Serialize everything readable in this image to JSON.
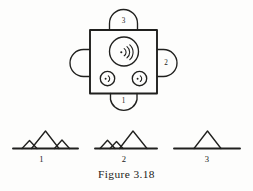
{
  "figure": {
    "caption": "Figure 3.18",
    "background_color": "#fdfdfc",
    "ink_color": "#20201e"
  },
  "device": {
    "name": "square-body",
    "emitter_large": {
      "symbol": "signal-emitter",
      "arcs": 3
    },
    "emitter_small_left": {
      "symbol": "signal-emitter",
      "arcs": 1
    },
    "emitter_small_right": {
      "symbol": "signal-emitter",
      "arcs": 1
    },
    "ports": [
      {
        "position": "top",
        "label": "3"
      },
      {
        "position": "right",
        "label": "2"
      },
      {
        "position": "bottom",
        "label": "1"
      },
      {
        "position": "left",
        "label": ""
      }
    ]
  },
  "waveforms": [
    {
      "label": "1",
      "description": "small peak, large center peak, small peak",
      "peaks": [
        {
          "x": 0.22,
          "height": 0.38
        },
        {
          "x": 0.5,
          "height": 1.0
        },
        {
          "x": 0.78,
          "height": 0.4
        }
      ]
    },
    {
      "label": "2",
      "description": "two small peaks at left, one tall peak at right",
      "peaks": [
        {
          "x": 0.2,
          "height": 0.4
        },
        {
          "x": 0.36,
          "height": 0.34
        },
        {
          "x": 0.66,
          "height": 1.0
        }
      ]
    },
    {
      "label": "3",
      "description": "single centered peak",
      "peaks": [
        {
          "x": 0.5,
          "height": 1.0
        }
      ]
    }
  ]
}
